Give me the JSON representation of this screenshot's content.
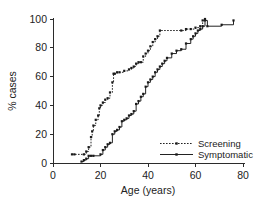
{
  "figure": {
    "background_color": "#ffffff",
    "ink_color": "#222222"
  },
  "chart_data": {
    "type": "line",
    "title": "",
    "subtitle": "",
    "xlabel": "Age (years)",
    "ylabel": "% cases",
    "xlim": [
      0,
      80
    ],
    "ylim": [
      0,
      100
    ],
    "xticks": [
      0,
      20,
      40,
      60,
      80
    ],
    "yticks": [
      0,
      20,
      40,
      60,
      80,
      100
    ],
    "xtick_labels": [
      "0",
      "20",
      "40",
      "60",
      "80"
    ],
    "ytick_labels": [
      "0",
      "20",
      "40",
      "60",
      "80",
      "100"
    ],
    "grid": false,
    "legend_position": "lower-right",
    "step_style": "post",
    "series": [
      {
        "name": "Screening",
        "line_style": "dotted",
        "marker": "square",
        "color": "#222222",
        "x": [
          8,
          9,
          13,
          14,
          15,
          16,
          16.5,
          17,
          18,
          19,
          19.5,
          20,
          21,
          22,
          23,
          24,
          25,
          25.5,
          26,
          27,
          28,
          30,
          32,
          33,
          34,
          35,
          36,
          37,
          38,
          39,
          40,
          41,
          42,
          43,
          44,
          45,
          54,
          56,
          58,
          60,
          62,
          63,
          64
        ],
        "y": [
          6,
          6,
          6,
          8,
          11,
          18,
          22,
          26,
          30,
          33,
          38,
          40,
          42,
          44,
          45,
          49,
          56,
          62,
          62,
          63,
          63,
          64,
          65,
          66,
          67,
          69,
          70,
          70,
          74,
          76,
          78,
          81,
          84,
          86,
          88,
          92,
          92,
          93,
          93,
          94,
          95,
          99,
          100
        ]
      },
      {
        "name": "Symptomatic",
        "line_style": "solid",
        "marker": "square",
        "color": "#222222",
        "x": [
          12,
          13,
          14,
          15,
          16,
          17,
          20,
          21,
          22,
          23,
          24,
          25,
          26,
          27,
          28,
          29,
          30,
          31,
          32,
          33,
          34,
          35,
          36,
          37,
          38,
          39,
          40,
          41,
          42,
          43,
          44,
          45,
          46,
          47,
          48,
          50,
          52,
          54,
          56,
          58,
          59,
          60,
          61,
          62,
          63,
          64,
          65,
          71,
          76
        ],
        "y": [
          1,
          2,
          3,
          5,
          5,
          5,
          6,
          9,
          11,
          13,
          14,
          20,
          22,
          23,
          25,
          29,
          30,
          31,
          33,
          34,
          36,
          41,
          43,
          46,
          48,
          53,
          56,
          58,
          60,
          63,
          65,
          67,
          69,
          71,
          73,
          76,
          78,
          79,
          83,
          86,
          88,
          90,
          92,
          93,
          95,
          99,
          95,
          96,
          99
        ]
      }
    ],
    "legend": [
      {
        "label": "Screening",
        "line_style": "dotted"
      },
      {
        "label": "Symptomatic",
        "line_style": "solid"
      }
    ]
  }
}
